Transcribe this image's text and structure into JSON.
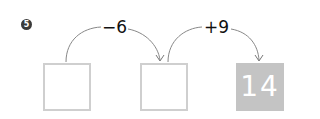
{
  "problem": {
    "number": "5",
    "steps": [
      {
        "operation": "−6"
      },
      {
        "operation": "+9"
      }
    ],
    "boxes": [
      {
        "value": "",
        "filled": false
      },
      {
        "value": "",
        "filled": false
      },
      {
        "value": "14",
        "filled": true
      }
    ]
  },
  "colors": {
    "box_border": "#cfcfcf",
    "filled_box": "#c4c4c4",
    "arc": "#777777"
  }
}
